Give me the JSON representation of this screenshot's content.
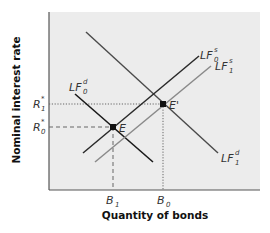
{
  "diagram": {
    "y_axis_label": "Nominal interest rate",
    "x_axis_label": "Quantity of bonds",
    "curves": [
      {
        "id": "LF0s",
        "name": "LF",
        "sup": "s",
        "sub": "0",
        "color": "#2a2a2a",
        "style": "solid"
      },
      {
        "id": "LF1s",
        "name": "LF",
        "sup": "s",
        "sub": "1",
        "color": "#8a8a8a",
        "style": "solid"
      },
      {
        "id": "LF0d",
        "name": "LF",
        "sup": "d",
        "sub": "0",
        "color": "#1a1a1a",
        "style": "solid"
      },
      {
        "id": "LF1d",
        "name": "LF",
        "sup": "d",
        "sub": "1",
        "color": "#4a4a4a",
        "style": "solid"
      }
    ],
    "points": [
      {
        "id": "E",
        "label": "E"
      },
      {
        "id": "E_prime",
        "label": "E'"
      }
    ],
    "y_ticks": [
      {
        "name": "R",
        "sup": "*",
        "sub": "1"
      },
      {
        "name": "R",
        "sup": "*",
        "sub": "0"
      }
    ],
    "x_ticks": [
      {
        "name": "B",
        "sub": "1"
      },
      {
        "name": "B",
        "sub": "0"
      }
    ],
    "colors": {
      "plot_background": "#ececec",
      "axis": "#555555",
      "guide_line": "#666666"
    }
  }
}
